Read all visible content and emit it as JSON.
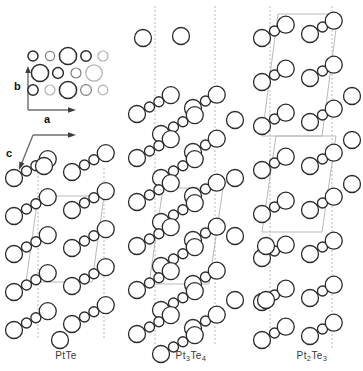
{
  "figure": {
    "background": "#ffffff",
    "line_color": "#2b2b2b",
    "cell_color": "#b9b9b9",
    "faded_atom_color": "#b0b0b0"
  },
  "axes": {
    "projection_key": {
      "vertical_label": "b",
      "horizontal_label": "a"
    },
    "section_key": {
      "horizontal_label": "a",
      "diagonal_label": "c"
    }
  },
  "panels": [
    {
      "id": "panel-ptte",
      "caption": "PtTe",
      "caption_html": "PtTe",
      "x": 10,
      "width": 112
    },
    {
      "id": "panel-pt3te4",
      "caption": "Pt3Te4",
      "caption_html": "Pt<sub>3</sub>Te<sub>4</sub>",
      "x": 135,
      "width": 112
    },
    {
      "id": "panel-pt2te3",
      "caption": "Pt2Te3",
      "caption_html": "Pt<sub>2</sub>Te<sub>3</sub>",
      "x": 256,
      "width": 112
    }
  ],
  "atoms": {
    "large_radius": 8.5,
    "small_radius": 5.0,
    "stroke_width": 1.3
  },
  "top_cluster": {
    "rows": [
      {
        "y": 56,
        "atoms": [
          {
            "x": 33,
            "r": 5.0,
            "shade": "dark"
          },
          {
            "x": 50,
            "r": 4.6,
            "shade": "mid"
          },
          {
            "x": 68,
            "r": 8.6,
            "shade": "dark"
          },
          {
            "x": 86,
            "r": 5.2,
            "shade": "dark"
          },
          {
            "x": 103,
            "r": 5.0,
            "shade": "light"
          }
        ]
      },
      {
        "y": 73,
        "atoms": [
          {
            "x": 40,
            "r": 8.6,
            "shade": "dark"
          },
          {
            "x": 58,
            "r": 5.4,
            "shade": "dark"
          },
          {
            "x": 76,
            "r": 5.0,
            "shade": "mid"
          },
          {
            "x": 94,
            "r": 8.2,
            "shade": "light"
          }
        ]
      },
      {
        "y": 90,
        "atoms": [
          {
            "x": 33,
            "r": 5.2,
            "shade": "dark"
          },
          {
            "x": 50,
            "r": 5.0,
            "shade": "light"
          },
          {
            "x": 68,
            "r": 8.6,
            "shade": "dark"
          },
          {
            "x": 86,
            "r": 5.4,
            "shade": "mid"
          },
          {
            "x": 103,
            "r": 4.8,
            "shade": "light"
          }
        ]
      }
    ]
  },
  "chart_data": {
    "type": "diagram",
    "legend": [
      {
        "symbol": "large-open-circle",
        "meaning": "Te"
      },
      {
        "symbol": "small-open-circle",
        "meaning": "Pt"
      }
    ],
    "panels": [
      "PtTe",
      "Pt3Te4",
      "Pt2Te3"
    ]
  }
}
